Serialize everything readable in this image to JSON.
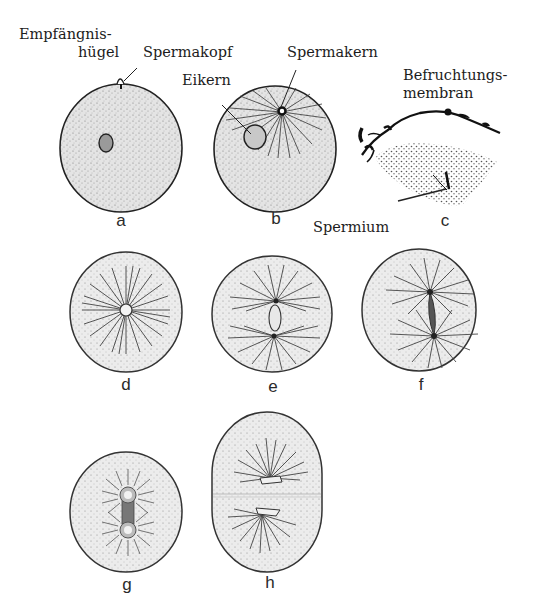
{
  "figure": {
    "annotations": {
      "empfaengnishuegel_line1": "Empfängnis-",
      "empfaengnishuegel_line2": "hügel",
      "spermakopf": "Spermakopf",
      "spermakern": "Spermakern",
      "eikern": "Eikern",
      "befruchtungsmembran_line1": "Befruchtungs-",
      "befruchtungsmembran_line2": "membran",
      "spermium": "Spermium"
    },
    "panels": [
      {
        "id": "a",
        "label": "a",
        "shape": "circle",
        "features": [
          "fertilization cone",
          "egg nucleus"
        ]
      },
      {
        "id": "b",
        "label": "b",
        "shape": "circle",
        "features": [
          "sperm aster",
          "egg nucleus",
          "sperm nucleus"
        ]
      },
      {
        "id": "c",
        "label": "c",
        "shape": "detail",
        "features": [
          "fertilization membrane",
          "sperm entering"
        ]
      },
      {
        "id": "d",
        "label": "d",
        "shape": "circle",
        "features": [
          "single aster",
          "fused nucleus"
        ]
      },
      {
        "id": "e",
        "label": "e",
        "shape": "circle",
        "features": [
          "two asters",
          "nucleus between poles"
        ]
      },
      {
        "id": "f",
        "label": "f",
        "shape": "circle",
        "features": [
          "two asters",
          "spindle"
        ]
      },
      {
        "id": "g",
        "label": "g",
        "shape": "circle",
        "features": [
          "two asters",
          "daughter nuclei"
        ]
      },
      {
        "id": "h",
        "label": "h",
        "shape": "oval",
        "features": [
          "cleavage furrow",
          "two daughter cells"
        ]
      }
    ],
    "colors": {
      "ink": "#1c1c1c",
      "cytoplasm": "#d9d9d9",
      "background": "#ffffff"
    }
  }
}
